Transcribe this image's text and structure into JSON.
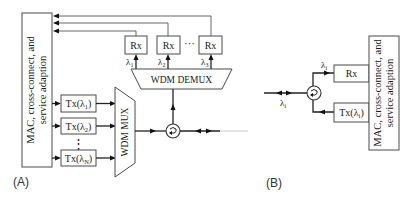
{
  "panel_a": {
    "label": "(A)",
    "mac_box": {
      "line1": "MAC, cross-connect, and",
      "line2": "service adaption"
    },
    "transmitters": [
      {
        "label": "Tx(λ",
        "sub": "1",
        "close": ")"
      },
      {
        "label": "Tx(λ",
        "sub": "2",
        "close": ")"
      },
      {
        "label": "Tx(λ",
        "sub": "N",
        "close": ")"
      }
    ],
    "tx_ellipsis": "⋮",
    "mux_label": "WDM MUX",
    "demux_label": "WDM DEMUX",
    "receivers": [
      {
        "label": "Rx",
        "wavelength": "λ",
        "sub": "1"
      },
      {
        "label": "Rx",
        "wavelength": "λ",
        "sub": "2"
      },
      {
        "label": "Rx",
        "wavelength": "λ",
        "sub": "3"
      }
    ],
    "rx_ellipsis": "···",
    "circulator_icon": "circulator-icon"
  },
  "panel_b": {
    "label": "(B)",
    "mac_box": {
      "line1": "MAC, cross-connect, and",
      "line2": "service adaption"
    },
    "rx": {
      "label": "Rx",
      "wavelength": "λ",
      "sub": "i"
    },
    "tx": {
      "label": "Tx(λ",
      "sub": "i",
      "close": ")"
    },
    "fiber_wavelength": {
      "symbol": "λ",
      "sub": "i"
    },
    "circulator_icon": "circulator-icon"
  },
  "colors": {
    "line": "#222222",
    "box_border": "#4a4a4a",
    "background": "#ffffff"
  }
}
